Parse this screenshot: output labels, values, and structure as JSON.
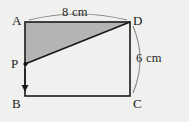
{
  "figure": {
    "kind": "rectangle-with-shaded-triangle",
    "background_color": "#f0f0ee",
    "stroke_color": "#1a1a1a",
    "shade_color": "#b4b4b4",
    "arc_color": "#8a8a8a",
    "vertices": {
      "A": {
        "label": "A",
        "x": 25,
        "y": 22
      },
      "B": {
        "label": "B",
        "x": 25,
        "y": 96
      },
      "C": {
        "label": "C",
        "x": 130,
        "y": 96
      },
      "D": {
        "label": "D",
        "x": 130,
        "y": 22
      },
      "P": {
        "label": "P",
        "x": 25,
        "y": 64
      }
    },
    "dimensions": {
      "width_label": "8 cm",
      "height_label": "6 cm"
    },
    "arrow": {
      "name": "downward-motion-arrow",
      "from_y": 68,
      "to_y": 90,
      "x": 25
    }
  }
}
